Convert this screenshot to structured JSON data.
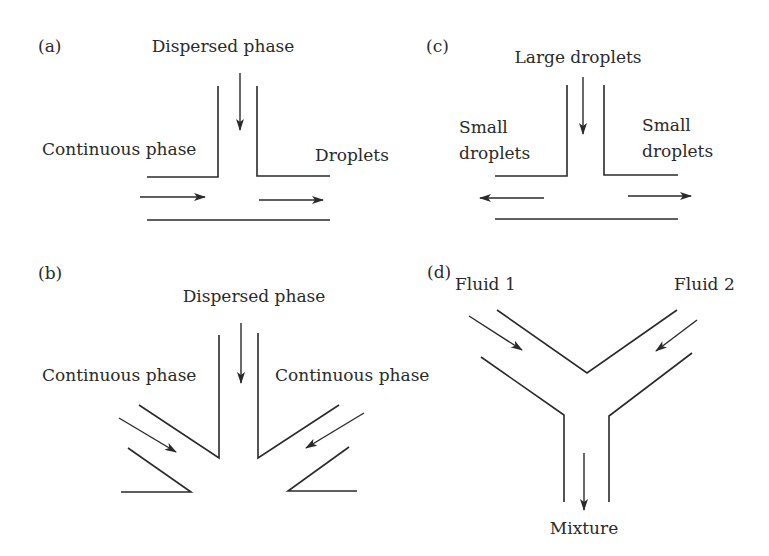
{
  "figure": {
    "panels": [
      {
        "id": "a",
        "panel_label": "(a)",
        "type": "T-junction",
        "labels": {
          "top": "Dispersed phase",
          "left": "Continuous phase",
          "right": "Droplets"
        }
      },
      {
        "id": "b",
        "panel_label": "(b)",
        "type": "flow-focusing junction",
        "labels": {
          "top": "Dispersed phase",
          "left": "Continuous phase",
          "right": "Continuous phase"
        }
      },
      {
        "id": "c",
        "panel_label": "(c)",
        "type": "T-junction breakup",
        "labels": {
          "top": "Large droplets",
          "left_line1": "Small",
          "left_line2": "droplets",
          "right_line1": "Small",
          "right_line2": "droplets"
        }
      },
      {
        "id": "d",
        "panel_label": "(d)",
        "type": "Y-junction",
        "labels": {
          "left": "Fluid 1",
          "right": "Fluid 2",
          "bottom": "Mixture"
        }
      }
    ]
  },
  "colors": {
    "ink": "#2a2a2a",
    "background": "#ffffff"
  }
}
